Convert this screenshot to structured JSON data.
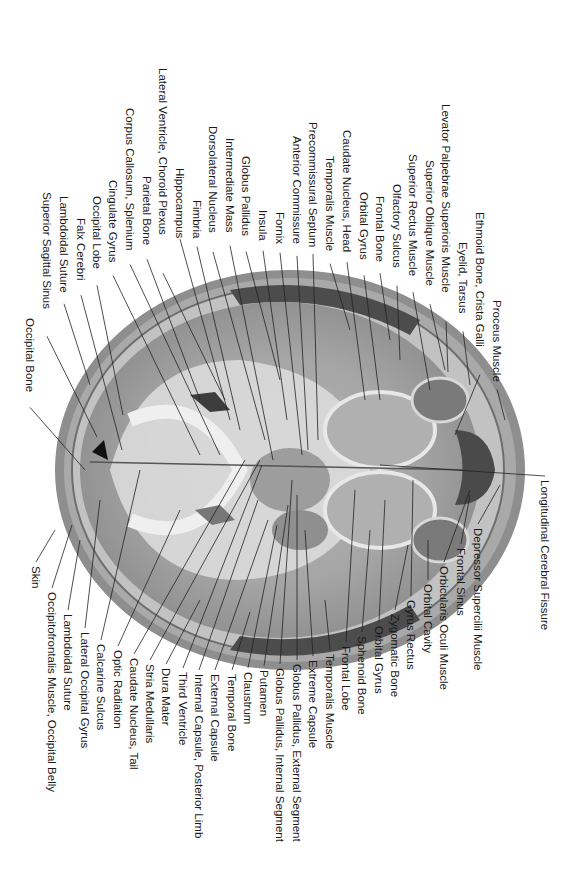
{
  "figure": {
    "orientation": "rotated-90-clockwise",
    "colors": {
      "background": "#ffffff",
      "text": "#1a1a1a",
      "leader": "#222222",
      "skin": "#8a8a8a",
      "bone": "#b8b8b8",
      "grey_matter": "#9a9a9a",
      "white_matter": "#e4e4e4",
      "muscle": "#4a4a4a"
    }
  },
  "labels_top": [
    {
      "text": "Occipital Bone",
      "x": 30,
      "y": 318,
      "tx": 85,
      "ty": 470
    },
    {
      "text": "Superior Sagittal Sinus",
      "x": 47,
      "y": 192,
      "tx": 97,
      "ty": 437
    },
    {
      "text": "Lambdoidal Suture",
      "x": 64,
      "y": 196,
      "tx": 90,
      "ty": 385
    },
    {
      "text": "Falx Cerebri",
      "x": 81,
      "y": 218,
      "tx": 122,
      "ty": 450
    },
    {
      "text": "Occipital Lobe",
      "x": 97,
      "y": 196,
      "tx": 123,
      "ty": 415
    },
    {
      "text": "Cingulate Gyrus",
      "x": 113,
      "y": 180,
      "tx": 200,
      "ty": 455
    },
    {
      "text": "Corpus Callosum, Splenium",
      "x": 130,
      "y": 108,
      "tx": 220,
      "ty": 455
    },
    {
      "text": "Parietal Bone",
      "x": 147,
      "y": 176,
      "tx": 200,
      "ty": 400
    },
    {
      "text": "Lateral Ventricle, Choroid Plexus",
      "x": 163,
      "y": 68,
      "tx": 225,
      "ty": 400
    },
    {
      "text": "Hippocampus",
      "x": 180,
      "y": 168,
      "tx": 230,
      "ty": 420
    },
    {
      "text": "Fimbria",
      "x": 197,
      "y": 200,
      "tx": 240,
      "ty": 430
    },
    {
      "text": "Dorsolateral Nucleus",
      "x": 213,
      "y": 126,
      "tx": 265,
      "ty": 440
    },
    {
      "text": "Intermediate Mass",
      "x": 230,
      "y": 138,
      "tx": 273,
      "ty": 460
    },
    {
      "text": "Globus Pallidus",
      "x": 246,
      "y": 156,
      "tx": 280,
      "ty": 380
    },
    {
      "text": "Insula",
      "x": 263,
      "y": 210,
      "tx": 287,
      "ty": 420
    },
    {
      "text": "Fornix",
      "x": 280,
      "y": 212,
      "tx": 302,
      "ty": 455
    },
    {
      "text": "Anterior Commissure",
      "x": 297,
      "y": 136,
      "tx": 308,
      "ty": 450
    },
    {
      "text": "Precommissural Septum",
      "x": 313,
      "y": 122,
      "tx": 318,
      "ty": 440
    },
    {
      "text": "Temporalis Muscle",
      "x": 330,
      "y": 156,
      "tx": 350,
      "ty": 330
    },
    {
      "text": "Caudate Nucleus, Head",
      "x": 347,
      "y": 130,
      "tx": 365,
      "ty": 400
    },
    {
      "text": "Orbital Gyrus",
      "x": 364,
      "y": 192,
      "tx": 380,
      "ty": 400
    },
    {
      "text": "Frontal Bone",
      "x": 380,
      "y": 196,
      "tx": 390,
      "ty": 340
    },
    {
      "text": "Olfactory Sulcus",
      "x": 397,
      "y": 184,
      "tx": 400,
      "ty": 360
    },
    {
      "text": "Superior Rectus Muscle",
      "x": 413,
      "y": 154,
      "tx": 430,
      "ty": 390
    },
    {
      "text": "Superior Oblique Muscle",
      "x": 430,
      "y": 160,
      "tx": 445,
      "ty": 370
    },
    {
      "text": "Levator Palpebrae Superioris Muscle",
      "x": 446,
      "y": 104,
      "tx": 448,
      "ty": 372
    },
    {
      "text": "Eyelid, Tarsus",
      "x": 463,
      "y": 242,
      "tx": 470,
      "ty": 385
    },
    {
      "text": "Ethmoid Bone, Crista Galli",
      "x": 480,
      "y": 212,
      "tx": 455,
      "ty": 435
    },
    {
      "text": "Proceus Muscle",
      "x": 497,
      "y": 300,
      "tx": 505,
      "ty": 420
    }
  ],
  "labels_right": [
    {
      "text": "Longitudinal Cerebral Fissure",
      "x": 545,
      "y": 480,
      "tx": 380,
      "ty": 465
    }
  ],
  "labels_bottom": [
    {
      "text": "Skin",
      "x": 36,
      "y": 566,
      "tx": 55,
      "ty": 530
    },
    {
      "text": "Occipitofrontalis Muscle, Occipital Belly",
      "x": 52,
      "y": 592,
      "tx": 72,
      "ty": 525
    },
    {
      "text": "Lambdoidal Suture",
      "x": 68,
      "y": 614,
      "tx": 80,
      "ty": 540
    },
    {
      "text": "Lateral Occipital Gyrus",
      "x": 85,
      "y": 632,
      "tx": 100,
      "ty": 500
    },
    {
      "text": "Calcarine Sulcus",
      "x": 101,
      "y": 644,
      "tx": 140,
      "ty": 470
    },
    {
      "text": "Optic Radiation",
      "x": 118,
      "y": 650,
      "tx": 180,
      "ty": 510
    },
    {
      "text": "Caudate Nucleus, Tail",
      "x": 134,
      "y": 658,
      "tx": 245,
      "ty": 460
    },
    {
      "text": "Stria Medullaris",
      "x": 150,
      "y": 664,
      "tx": 260,
      "ty": 460
    },
    {
      "text": "Dura Mater",
      "x": 166,
      "y": 668,
      "tx": 200,
      "ty": 600
    },
    {
      "text": "Third Ventricle",
      "x": 183,
      "y": 672,
      "tx": 262,
      "ty": 465
    },
    {
      "text": "Internal Capsule, Posterior Limb",
      "x": 199,
      "y": 674,
      "tx": 258,
      "ty": 500
    },
    {
      "text": "External Capsule",
      "x": 215,
      "y": 674,
      "tx": 268,
      "ty": 520
    },
    {
      "text": "Temporal Bone",
      "x": 232,
      "y": 674,
      "tx": 250,
      "ty": 612
    },
    {
      "text": "Claustrum",
      "x": 248,
      "y": 672,
      "tx": 277,
      "ty": 525
    },
    {
      "text": "Putamen",
      "x": 264,
      "y": 670,
      "tx": 288,
      "ty": 505
    },
    {
      "text": "Globus Pallidus, Internal Segment",
      "x": 280,
      "y": 668,
      "tx": 292,
      "ty": 480
    },
    {
      "text": "Globus Pallidus, External Segment",
      "x": 297,
      "y": 664,
      "tx": 297,
      "ty": 495
    },
    {
      "text": "Extreme Capsule",
      "x": 313,
      "y": 660,
      "tx": 305,
      "ty": 530
    },
    {
      "text": "Temporalis Muscle",
      "x": 330,
      "y": 654,
      "tx": 325,
      "ty": 600
    },
    {
      "text": "Frontal Lobe",
      "x": 346,
      "y": 646,
      "tx": 355,
      "ty": 490
    },
    {
      "text": "Sphenoid Bone",
      "x": 362,
      "y": 636,
      "tx": 370,
      "ty": 530
    },
    {
      "text": "Orbital Gyrus",
      "x": 379,
      "y": 626,
      "tx": 385,
      "ty": 500
    },
    {
      "text": "Zygomatic Bone",
      "x": 395,
      "y": 614,
      "tx": 408,
      "ty": 545
    },
    {
      "text": "Gyrus Rectus",
      "x": 411,
      "y": 600,
      "tx": 413,
      "ty": 480
    },
    {
      "text": "Orbital Cavity",
      "x": 428,
      "y": 584,
      "tx": 428,
      "ty": 540
    },
    {
      "text": "Orbicularis Oculi Muscle",
      "x": 444,
      "y": 566,
      "tx": 470,
      "ty": 490
    },
    {
      "text": "Frontal Sinus",
      "x": 461,
      "y": 548,
      "tx": 470,
      "ty": 495
    },
    {
      "text": "Depressor Supercilii Muscle",
      "x": 478,
      "y": 528,
      "tx": 500,
      "ty": 485
    }
  ]
}
